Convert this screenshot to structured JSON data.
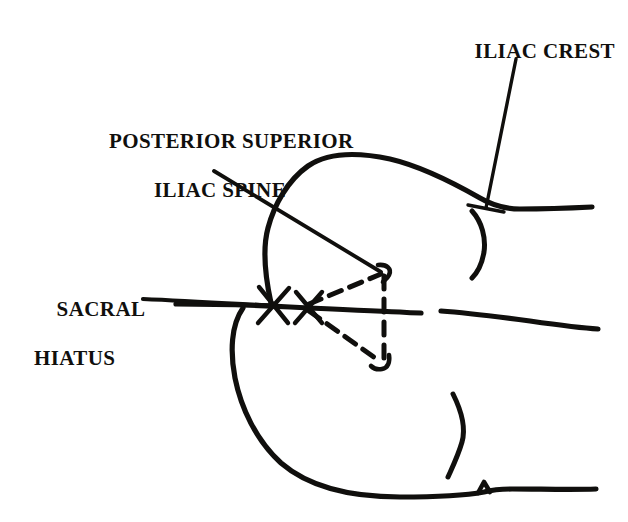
{
  "diagram": {
    "type": "anatomical-line-drawing",
    "background_color": "#ffffff",
    "ink_color": "#100f0d",
    "labels": [
      {
        "id": "iliac-crest",
        "text": "ILIAC CREST",
        "lines": [
          "ILIAC CREST"
        ],
        "position": {
          "x": 452,
          "y": 14
        },
        "align": "left"
      },
      {
        "id": "posterior-superior-iliac-spine",
        "text": "POSTERIOR SUPERIOR ILIAC SPINE",
        "lines": [
          "POSTERIOR SUPERIOR",
          "ILIAC SPINE"
        ],
        "position": {
          "x": 72,
          "y": 104
        },
        "align": "center"
      },
      {
        "id": "sacral-hiatus",
        "text": "SACRAL HIATUS",
        "lines": [
          "SACRAL",
          "HIATUS"
        ],
        "position": {
          "x": 34,
          "y": 272
        },
        "align": "left"
      }
    ],
    "leader_lines": [
      {
        "id": "leader-iliac-crest",
        "from": [
          516,
          59
        ],
        "to": [
          486,
          208
        ]
      },
      {
        "id": "leader-psis",
        "from": [
          214,
          171
        ],
        "to": [
          381,
          272
        ]
      },
      {
        "id": "leader-sacral-hiatus",
        "from": [
          143,
          299
        ],
        "to": [
          277,
          306
        ]
      }
    ],
    "markers": [
      {
        "id": "cross-marker-sacral-hiatus",
        "x": 273,
        "y": 305
      },
      {
        "id": "cross-marker-triangle-apex",
        "x": 308,
        "y": 307
      },
      {
        "id": "cross-marker-iliac-crest",
        "x": 486,
        "y": 208
      }
    ],
    "dashed_triangle": {
      "id": "dashed-triangle",
      "apex": [
        308,
        307
      ],
      "top_vertex": [
        383,
        272
      ],
      "bottom_vertex": [
        382,
        362
      ],
      "style": "dashed"
    },
    "outline_parts": [
      "upper-iliac-lobe",
      "lower-iliac-lobe",
      "sacral-midline",
      "right-upper-bracket",
      "right-lower-bracket"
    ]
  }
}
